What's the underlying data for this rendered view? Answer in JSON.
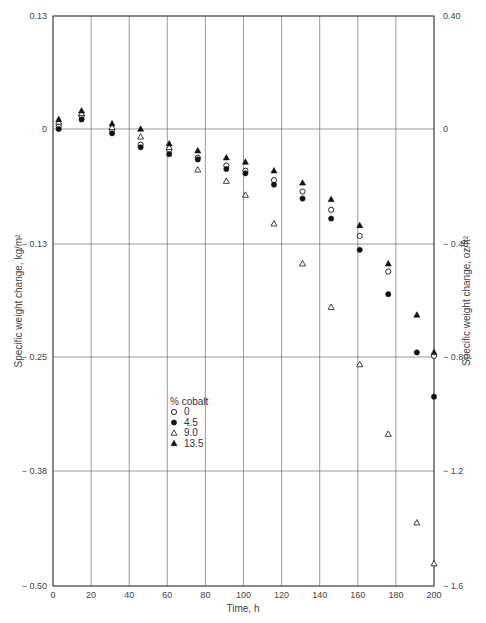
{
  "chart_data": {
    "type": "scatter",
    "title": "",
    "xlabel": "Time, h",
    "ylabel": "Specific weight change, kg/m²",
    "ylabel_right": "Specific weight change, oz/ft²",
    "xlim": [
      0,
      200
    ],
    "ylim": [
      -0.5,
      0.13
    ],
    "ylim_right": [
      -1.6,
      0.4
    ],
    "grid": true,
    "x_ticks": [
      "0",
      "20",
      "40",
      "60",
      "80",
      "100",
      "120",
      "140",
      "160",
      "180",
      "200"
    ],
    "y_ticks": [
      "0.13",
      "0",
      "-0.13",
      "-0.25",
      "-0.38",
      "-0.50"
    ],
    "y_ticks_right": [
      "0.40",
      "0",
      "-0.40",
      "-0.80",
      "-1.2",
      "-1.6"
    ],
    "legend": {
      "title": "% cobalt",
      "position": "inside-left-lower",
      "entries": [
        "0",
        "4.5",
        "9.0",
        "13.5"
      ]
    },
    "series": [
      {
        "name": "0",
        "marker": "open-circle",
        "x": [
          3,
          15,
          31,
          46,
          61,
          76,
          91,
          101,
          116,
          131,
          146,
          161,
          176,
          200
        ],
        "y": [
          0.003,
          0.015,
          -0.001,
          -0.018,
          -0.024,
          -0.033,
          -0.042,
          -0.048,
          -0.059,
          -0.072,
          -0.093,
          -0.123,
          -0.164,
          -0.261
        ]
      },
      {
        "name": "4.5",
        "marker": "filled-circle",
        "x": [
          3,
          15,
          31,
          46,
          61,
          76,
          91,
          101,
          116,
          131,
          146,
          161,
          176,
          191,
          200
        ],
        "y": [
          0.0,
          0.011,
          -0.005,
          -0.021,
          -0.029,
          -0.035,
          -0.046,
          -0.051,
          -0.064,
          -0.08,
          -0.103,
          -0.139,
          -0.19,
          -0.257,
          -0.308
        ]
      },
      {
        "name": "9.0",
        "marker": "open-triangle",
        "x": [
          3,
          15,
          31,
          46,
          61,
          76,
          91,
          101,
          116,
          131,
          146,
          161,
          176,
          191,
          200
        ],
        "y": [
          0.008,
          0.018,
          0.002,
          -0.009,
          -0.021,
          -0.047,
          -0.06,
          -0.076,
          -0.109,
          -0.155,
          -0.205,
          -0.271,
          -0.351,
          -0.453,
          -0.5
        ]
      },
      {
        "name": "13.5",
        "marker": "filled-triangle",
        "x": [
          3,
          15,
          31,
          46,
          61,
          76,
          91,
          101,
          116,
          131,
          146,
          161,
          176,
          191,
          200
        ],
        "y": [
          0.011,
          0.021,
          0.006,
          0.0,
          -0.017,
          -0.025,
          -0.033,
          -0.038,
          -0.048,
          -0.062,
          -0.081,
          -0.111,
          -0.155,
          -0.214,
          -0.257
        ]
      }
    ]
  },
  "colors": {
    "grid": "#555555",
    "marker": "#111111",
    "text": "#444444"
  }
}
